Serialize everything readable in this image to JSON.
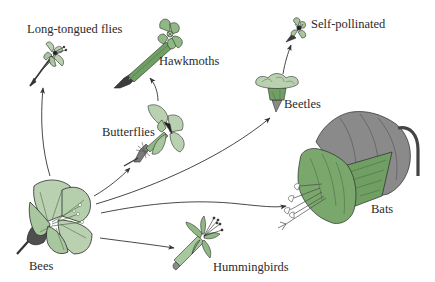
{
  "diagram": {
    "type": "evolutionary-radiation",
    "colors": {
      "petal_light": "#b9d1b0",
      "petal_mid": "#8fb884",
      "petal_dark": "#6a9a5e",
      "tube_green": "#6f9f62",
      "sepal_dark": "#555555",
      "bat_flower_grey": "#8a8a8a",
      "outline": "#2b2b2b",
      "arrow": "#333333",
      "text": "#2a2a2a"
    },
    "nodes": [
      {
        "id": "bees",
        "label": "Bees",
        "role": "ancestral"
      },
      {
        "id": "long_tongued_flies",
        "label": "Long-tongued flies"
      },
      {
        "id": "hawkmoths",
        "label": "Hawkmoths"
      },
      {
        "id": "butterflies",
        "label": "Butterflies"
      },
      {
        "id": "beetles",
        "label": "Beetles"
      },
      {
        "id": "self_pollinated",
        "label": "Self-pollinated"
      },
      {
        "id": "bats",
        "label": "Bats"
      },
      {
        "id": "hummingbirds",
        "label": "Hummingbirds"
      }
    ],
    "edges": [
      {
        "from": "bees",
        "to": "long_tongued_flies"
      },
      {
        "from": "bees",
        "to": "butterflies"
      },
      {
        "from": "butterflies",
        "to": "hawkmoths"
      },
      {
        "from": "bees",
        "to": "beetles"
      },
      {
        "from": "beetles",
        "to": "self_pollinated"
      },
      {
        "from": "bees",
        "to": "bats"
      },
      {
        "from": "bees",
        "to": "hummingbirds"
      }
    ]
  }
}
